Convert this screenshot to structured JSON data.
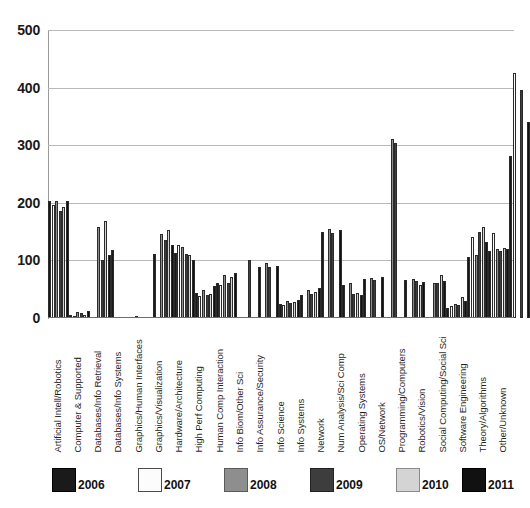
{
  "chart_data": {
    "type": "bar",
    "title": "",
    "xlabel": "",
    "ylabel": "",
    "ylim": [
      0,
      500
    ],
    "yticks": [
      0,
      100,
      200,
      300,
      400,
      500
    ],
    "grid": true,
    "legend_position": "bottom",
    "categories": [
      "Artificial Intell/Robotics",
      "Computer & Supported",
      "Databases/Info Retrieval",
      "Databases/Info Systems",
      "Graphics/Human Interfaces",
      "Graphics/Visualization",
      "Hardware/Architecture",
      "High Perf Computing",
      "Human Comp Interaction",
      "Info Biom/Other Sci",
      "Info Assurance/Security",
      "Info Science",
      "Info Systems",
      "Network",
      "Num Analysis/Sci Comp",
      "Operating Systems",
      "OS/Network",
      "Programming/Computers",
      "Robotics/Vision",
      "Social Computing/Social Sci",
      "Software Engineering",
      "Theory/Algorithms",
      "Other/Unknown"
    ],
    "series": [
      {
        "name": "2006",
        "color": "#1a1a1a",
        "values": [
          203,
          5,
          0,
          118,
          0,
          112,
          113,
          44,
          60,
          0,
          88,
          24,
          40,
          150,
          58,
          68,
          0,
          66,
          0,
          18,
          106,
          116,
          282
        ]
      },
      {
        "name": "2007",
        "color": "#fbfbfb",
        "values": [
          196,
          3,
          0,
          0,
          2,
          0,
          126,
          38,
          58,
          0,
          0,
          22,
          0,
          0,
          0,
          0,
          0,
          0,
          0,
          20,
          140,
          148,
          425
        ]
      },
      {
        "name": "2008",
        "color": "#8e8e8e",
        "values": [
          204,
          10,
          158,
          0,
          0,
          146,
          124,
          49,
          74,
          0,
          96,
          30,
          48,
          154,
          60,
          70,
          310,
          68,
          60,
          24,
          110,
          120,
          0
        ]
      },
      {
        "name": "2009",
        "color": "#3d3d3d",
        "values": [
          186,
          8,
          100,
          0,
          0,
          136,
          112,
          40,
          60,
          100,
          88,
          26,
          42,
          148,
          42,
          66,
          304,
          64,
          60,
          22,
          150,
          116,
          395
        ]
      },
      {
        "name": "2010",
        "color": "#d4d4d4",
        "values": [
          192,
          6,
          168,
          0,
          0,
          152,
          110,
          42,
          72,
          0,
          0,
          28,
          45,
          0,
          44,
          0,
          0,
          58,
          74,
          36,
          158,
          122,
          0
        ]
      },
      {
        "name": "2011",
        "color": "#111111",
        "values": [
          204,
          12,
          110,
          0,
          0,
          126,
          100,
          56,
          78,
          0,
          90,
          32,
          52,
          152,
          40,
          72,
          0,
          62,
          64,
          30,
          132,
          120,
          340
        ]
      }
    ]
  },
  "legend": {
    "items": [
      {
        "label": "2006",
        "color": "#1a1a1a",
        "border": "#000000"
      },
      {
        "label": "2007",
        "color": "#fcfcfc",
        "border": "#4a4a4a"
      },
      {
        "label": "2008",
        "color": "#8e8e8e",
        "border": "#5a5a5a"
      },
      {
        "label": "2009",
        "color": "#3d3d3d",
        "border": "#222222"
      },
      {
        "label": "2010",
        "color": "#d4d4d4",
        "border": "#8a8a8a"
      },
      {
        "label": "2011",
        "color": "#111111",
        "border": "#000000"
      }
    ]
  }
}
